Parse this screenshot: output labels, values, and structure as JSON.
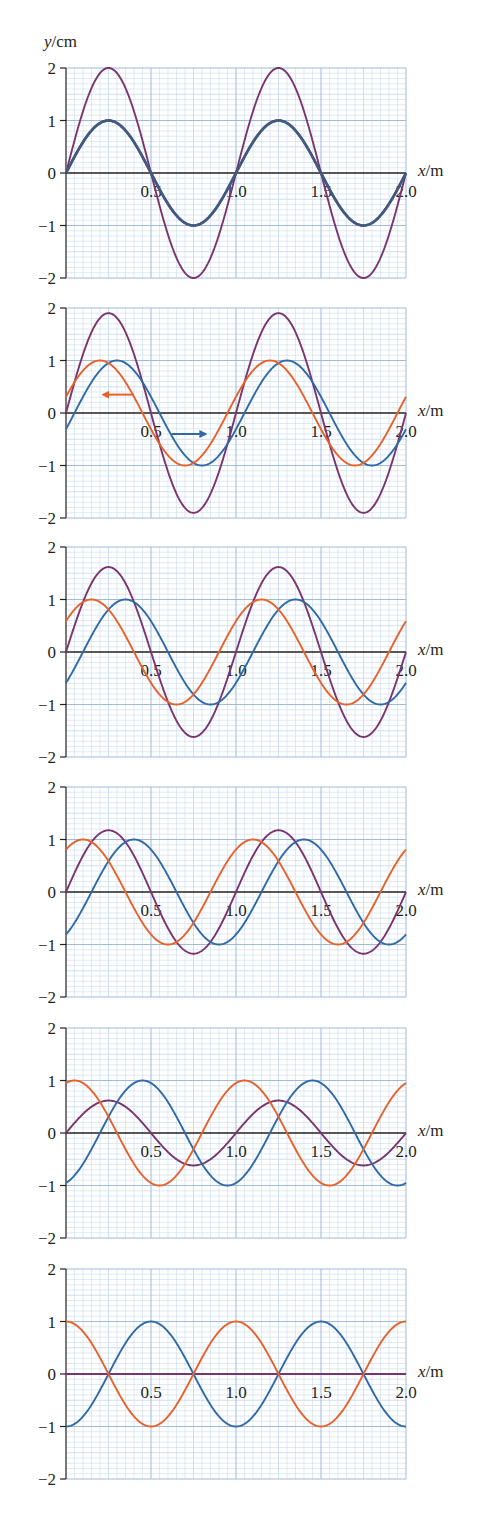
{
  "chart_data": {
    "type": "line",
    "title": "",
    "xlabel_var": "x",
    "xlabel_unit": "/m",
    "ylabel_var": "y",
    "ylabel_unit": "/cm",
    "xlim": [
      0,
      2.0
    ],
    "ylim": [
      -2,
      2
    ],
    "x_ticks": [
      "0.5",
      "1.0",
      "1.5",
      "2.0"
    ],
    "x_tick_values": [
      0.5,
      1.0,
      1.5,
      2.0
    ],
    "y_ticks": [
      "2",
      "1",
      "0",
      "−1",
      "−2"
    ],
    "y_tick_values": [
      2,
      1,
      0,
      -1,
      -2
    ],
    "grid": true,
    "grid_minor_x": 0.05,
    "grid_minor_y": 0.1,
    "wavelength_m": 1.0,
    "colors": {
      "orange": "#e8612a",
      "blue": "#2f69a8",
      "purple": "#7a3470",
      "overlap": "#43597f",
      "grid_minor": "#c9dbef",
      "grid_major": "#94b3d8",
      "axis": "#231f20"
    },
    "panels": [
      {
        "name": "panel-1",
        "series": [
          {
            "name": "orange wave",
            "formula": "sin(2πx)",
            "amplitude": 1,
            "phase_shift_m": 0.0,
            "color": "overlap"
          },
          {
            "name": "blue wave",
            "formula": "sin(2πx)",
            "amplitude": 1,
            "phase_shift_m": 0.0,
            "color": "overlap"
          },
          {
            "name": "resultant",
            "formula": "2sin(2πx)",
            "amplitude": 2.0,
            "peak_x": [
              0.25,
              1.25
            ],
            "color": "purple"
          }
        ],
        "arrows": []
      },
      {
        "name": "panel-2",
        "series": [
          {
            "name": "orange wave",
            "amplitude": 1,
            "phase_shift_m": 0.05,
            "peak_x": [
              0.2,
              1.2
            ],
            "color": "orange"
          },
          {
            "name": "blue wave",
            "amplitude": 1,
            "phase_shift_m": -0.05,
            "peak_x": [
              0.3,
              1.3
            ],
            "color": "blue"
          },
          {
            "name": "resultant",
            "amplitude": 1.9,
            "peak_x": [
              0.25,
              1.25
            ],
            "color": "purple"
          }
        ],
        "arrows": [
          {
            "name": "orange-direction-arrow",
            "direction": "left",
            "color": "orange",
            "x_from": 0.4,
            "x_to": 0.22,
            "y": 0.35
          },
          {
            "name": "blue-direction-arrow",
            "direction": "right",
            "color": "blue",
            "x_from": 0.62,
            "x_to": 0.82,
            "y": -0.4
          }
        ]
      },
      {
        "name": "panel-3",
        "series": [
          {
            "name": "orange wave",
            "amplitude": 1,
            "phase_shift_m": 0.1,
            "peak_x": [
              0.15,
              1.15
            ],
            "color": "orange"
          },
          {
            "name": "blue wave",
            "amplitude": 1,
            "phase_shift_m": -0.1,
            "peak_x": [
              0.35,
              1.35
            ],
            "color": "blue"
          },
          {
            "name": "resultant",
            "amplitude": 1.62,
            "peak_x": [
              0.25,
              1.25
            ],
            "color": "purple"
          }
        ],
        "arrows": []
      },
      {
        "name": "panel-4",
        "series": [
          {
            "name": "orange wave",
            "amplitude": 1,
            "phase_shift_m": 0.15,
            "peak_x": [
              0.1,
              1.1
            ],
            "color": "orange"
          },
          {
            "name": "blue wave",
            "amplitude": 1,
            "phase_shift_m": -0.15,
            "peak_x": [
              0.4,
              1.4
            ],
            "color": "blue"
          },
          {
            "name": "resultant",
            "amplitude": 1.18,
            "peak_x": [
              0.25,
              1.25
            ],
            "color": "purple"
          }
        ],
        "arrows": []
      },
      {
        "name": "panel-5",
        "series": [
          {
            "name": "orange wave",
            "amplitude": 1,
            "phase_shift_m": 0.2,
            "peak_x": [
              0.05,
              1.05
            ],
            "color": "orange"
          },
          {
            "name": "blue wave",
            "amplitude": 1,
            "phase_shift_m": -0.2,
            "peak_x": [
              0.45,
              1.45
            ],
            "color": "blue"
          },
          {
            "name": "resultant",
            "amplitude": 0.62,
            "peak_x": [
              0.25,
              1.25
            ],
            "color": "purple"
          }
        ],
        "arrows": []
      },
      {
        "name": "panel-6",
        "series": [
          {
            "name": "orange wave",
            "formula": "cos(2πx)",
            "amplitude": 1,
            "phase_shift_m": 0.25,
            "peak_x": [
              0.0,
              1.0,
              2.0
            ],
            "color": "orange"
          },
          {
            "name": "blue wave",
            "formula": "−cos(2πx)",
            "amplitude": 1,
            "phase_shift_m": -0.25,
            "peak_x": [
              0.5,
              1.5
            ],
            "color": "blue"
          },
          {
            "name": "resultant",
            "formula": "0",
            "amplitude": 0.0,
            "color": "purple"
          }
        ],
        "arrows": []
      }
    ]
  }
}
